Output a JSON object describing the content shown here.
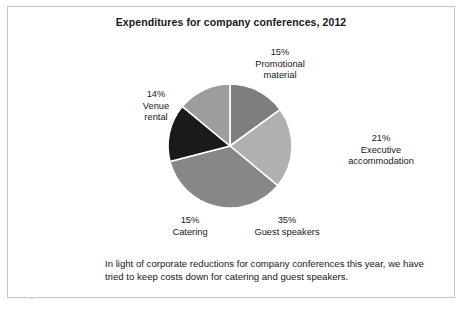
{
  "figure": {
    "title": "Expenditures for company conferences, 2012",
    "caption": "In light of corporate reductions for company conferences this year, we have tried to keep costs down for catering and guest speakers."
  },
  "labels": {
    "promotional": {
      "pct": "15%",
      "line1": "Promotional",
      "line2": "material"
    },
    "executive": {
      "pct": "21%",
      "line1": "Executive",
      "line2": "accommodation"
    },
    "guest": {
      "pct": "35%",
      "line1": "Guest speakers",
      "line2": ""
    },
    "catering": {
      "pct": "15%",
      "line1": "Catering",
      "line2": ""
    },
    "venue": {
      "pct": "14%",
      "line1": "Venue",
      "line2": "rental"
    }
  },
  "chart_data": {
    "type": "pie",
    "title": "Expenditures for company conferences, 2012",
    "subtitle": "",
    "xlabel": "",
    "ylabel": "",
    "legend_position": "none",
    "labels_position": "outside-radial",
    "start_angle_deg": 0,
    "direction": "clockwise",
    "total": 100,
    "unit": "%",
    "categories": [
      "Promotional material",
      "Executive accommodation",
      "Guest speakers",
      "Catering",
      "Venue rental"
    ],
    "values": [
      15,
      21,
      35,
      15,
      14
    ],
    "slices": [
      {
        "name": "Promotional material",
        "value": 15,
        "label": "15%",
        "color": "#7e7e7e",
        "angle_deg": 54.0
      },
      {
        "name": "Executive accommodation",
        "value": 21,
        "label": "21%",
        "color": "#b0b0b0",
        "angle_deg": 75.6
      },
      {
        "name": "Guest speakers",
        "value": 35,
        "label": "35%",
        "color": "#878787",
        "angle_deg": 126.0
      },
      {
        "name": "Catering",
        "value": 15,
        "label": "15%",
        "color": "#1a1a1a",
        "angle_deg": 54.0
      },
      {
        "name": "Venue rental",
        "value": 14,
        "label": "14%",
        "color": "#9d9d9d",
        "angle_deg": 50.4
      }
    ],
    "separator_color": "#ffffff",
    "grid": false,
    "annotations": [
      "In light of corporate reductions for company conferences this year, we have tried to keep costs down for catering and guest speakers."
    ]
  },
  "colors": {
    "background": "#ffffff",
    "frame_border": "#c9c9c9",
    "text": "#15181c"
  }
}
